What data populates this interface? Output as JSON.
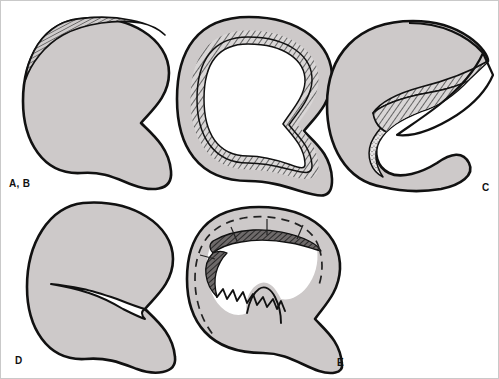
{
  "figure": {
    "background_color": "#ffffff",
    "border_color": "#c9c9c9",
    "fill_color": "#cdc9c9",
    "outline_color": "#111111",
    "hatch_color": "#4a4a4a",
    "stipple_color": "#5a5a5a",
    "dashed_color": "#222222"
  },
  "panels": [
    {
      "id": "panel-ab",
      "label": "A, B",
      "label_x": 8,
      "label_y": 186,
      "pattern": "intact meniscus with hatched superior rim cap",
      "features": [
        "hatched-cap",
        "solid-body"
      ]
    },
    {
      "id": "panel-middle",
      "label": "",
      "label_x": 0,
      "label_y": 0,
      "pattern": "meniscus with hatched inner lining band",
      "features": [
        "hatched-inner-band",
        "solid-body"
      ]
    },
    {
      "id": "panel-c",
      "label": "C",
      "label_x": 481,
      "label_y": 190,
      "pattern": "flap tear lifted exposing hatched and stippled layers",
      "features": [
        "lifted-flap",
        "hatched-layer",
        "stippled-layer"
      ]
    },
    {
      "id": "panel-d",
      "label": "D",
      "label_x": 14,
      "label_y": 363,
      "pattern": "radial split tear at inner free edge",
      "features": [
        "radial-cleft",
        "solid-body"
      ]
    },
    {
      "id": "panel-e",
      "label": "E",
      "label_x": 336,
      "label_y": 365,
      "pattern": "degenerative tear with ragged free edge and dashed original contour",
      "features": [
        "dashed-contour",
        "ragged-edge",
        "radial-fissures"
      ]
    }
  ]
}
